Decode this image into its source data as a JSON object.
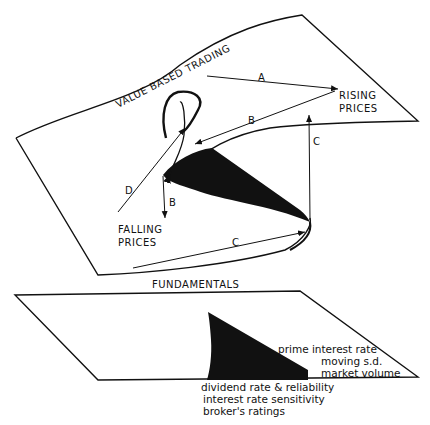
{
  "upper_surface": {
    "title": "VALUE BASED TRADING",
    "rising": [
      "RISING",
      "PRICES"
    ],
    "falling": [
      "FALLING",
      "PRICES"
    ],
    "paths": {
      "a": "A",
      "b1": "B",
      "b2": "B",
      "c1": "C",
      "c2": "C",
      "d": "D"
    }
  },
  "lower_surface": {
    "title": "FUNDAMENTALS",
    "right_labels": [
      "prime interest rate",
      "moving s.d.",
      "market volume"
    ],
    "bottom_labels": [
      "dividend rate & reliability",
      "interest rate sensitivity",
      "broker's ratings"
    ]
  },
  "colors": {
    "ink": "#111111",
    "background": "#ffffff"
  }
}
